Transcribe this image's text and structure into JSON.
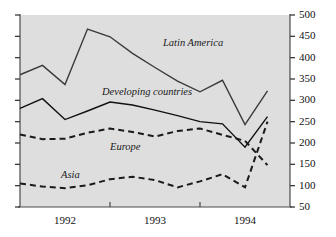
{
  "chart_data": {
    "type": "line",
    "title": "",
    "subtitle": "",
    "xlabel": "",
    "ylabel": "",
    "xlim": [
      0,
      12
    ],
    "ylim": [
      50,
      500
    ],
    "yaxis_position": "right",
    "grid": false,
    "legend": "inline-annotations",
    "background_color": "#dedede",
    "y_ticks": [
      500,
      450,
      400,
      350,
      300,
      250,
      200,
      150,
      100,
      50
    ],
    "x_ticks": [
      1992,
      1993,
      1994
    ],
    "x_tick_labels": [
      "1992",
      "1993",
      "1994"
    ],
    "x": [
      0,
      1,
      2,
      3,
      4,
      5,
      6,
      7,
      8,
      9,
      10,
      11
    ],
    "series": [
      {
        "name": "Latin America",
        "style": "solid",
        "color": "#3a3a3a",
        "label_x": 163,
        "label_y": 38,
        "values": [
          360,
          382,
          337,
          467,
          449,
          410,
          377,
          345,
          320,
          347,
          243,
          322
        ]
      },
      {
        "name": "Developing countries",
        "style": "solid",
        "color": "#111111",
        "label_x": 102,
        "label_y": 87,
        "values": [
          281,
          304,
          255,
          275,
          296,
          289,
          277,
          264,
          250,
          245,
          190,
          262
        ]
      },
      {
        "name": "Europe",
        "style": "dashed",
        "color": "#1a1a1a",
        "label_x": 110,
        "label_y": 142,
        "values": [
          220,
          209,
          210,
          224,
          234,
          226,
          215,
          228,
          234,
          219,
          205,
          148
        ]
      },
      {
        "name": "Asia",
        "style": "dashed",
        "color": "#1a1a1a",
        "label_x": 61,
        "label_y": 170,
        "values": [
          105,
          98,
          94,
          101,
          115,
          121,
          113,
          96,
          110,
          127,
          96,
          250
        ]
      }
    ]
  }
}
